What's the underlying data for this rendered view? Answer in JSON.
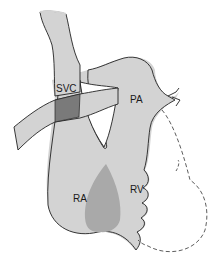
{
  "diagram": {
    "type": "anatomical-heart-schematic",
    "labels": {
      "svc": "SVC",
      "pa": "PA",
      "ra": "RA",
      "rv": "RV"
    },
    "colors": {
      "background": "#ffffff",
      "heart_fill": "#d3d3d3",
      "overlap_fill": "#a9a9a9",
      "svc_overlap_fill": "#7a7a7a",
      "outline": "#222222"
    }
  }
}
